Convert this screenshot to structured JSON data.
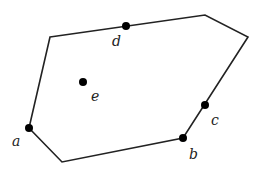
{
  "diagram": {
    "type": "convex-polygon-with-points",
    "stroke_color": "#222222",
    "point_color": "#000000",
    "polygon_vertices": [
      [
        50,
        37
      ],
      [
        205,
        15
      ],
      [
        248,
        37
      ],
      [
        183,
        138
      ],
      [
        62,
        162
      ],
      [
        29,
        128
      ]
    ],
    "points": [
      {
        "id": "a",
        "label": "a",
        "x": 29,
        "y": 128,
        "label_x": 12,
        "label_y": 146
      },
      {
        "id": "b",
        "label": "b",
        "x": 183,
        "y": 138,
        "label_x": 189,
        "label_y": 159
      },
      {
        "id": "c",
        "label": "c",
        "x": 205,
        "y": 105,
        "label_x": 211,
        "label_y": 125
      },
      {
        "id": "d",
        "label": "d",
        "x": 126,
        "y": 26,
        "label_x": 112,
        "label_y": 46
      },
      {
        "id": "e",
        "label": "e",
        "x": 83,
        "y": 82,
        "label_x": 91,
        "label_y": 101
      }
    ]
  }
}
